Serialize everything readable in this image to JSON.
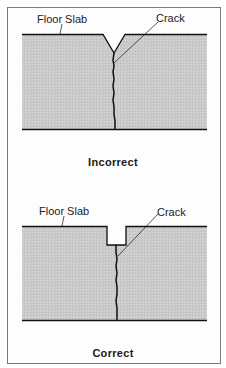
{
  "figures": [
    {
      "id": "incorrect",
      "labels": {
        "slab": "Floor Slab",
        "crack": "Crack"
      },
      "caption": "Incorrect",
      "joint_type": "V-groove"
    },
    {
      "id": "correct",
      "labels": {
        "slab": "Floor Slab",
        "crack": "Crack"
      },
      "caption": "Correct",
      "joint_type": "rectangular sawcut"
    }
  ],
  "colors": {
    "slab_fill": "#c9c9c9",
    "line": "#111111",
    "frame": "#7a7a7a"
  }
}
